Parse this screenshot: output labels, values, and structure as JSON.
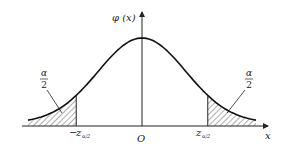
{
  "diagram": {
    "y_axis_label": "φ (x)",
    "x_axis_label": "x",
    "origin_label": "O",
    "left_cutoff": {
      "sign": "−",
      "var": "z",
      "sub": "α/2"
    },
    "right_cutoff": {
      "var": "z",
      "sub": "α/2"
    },
    "left_tail_label": {
      "num": "α",
      "den": "2"
    },
    "right_tail_label": {
      "num": "α",
      "den": "2"
    },
    "cutoff_z_value": 1.5,
    "x_range": [
      -2.6,
      2.6
    ],
    "colors": {
      "ink": "#222222",
      "background": "#ffffff"
    }
  }
}
